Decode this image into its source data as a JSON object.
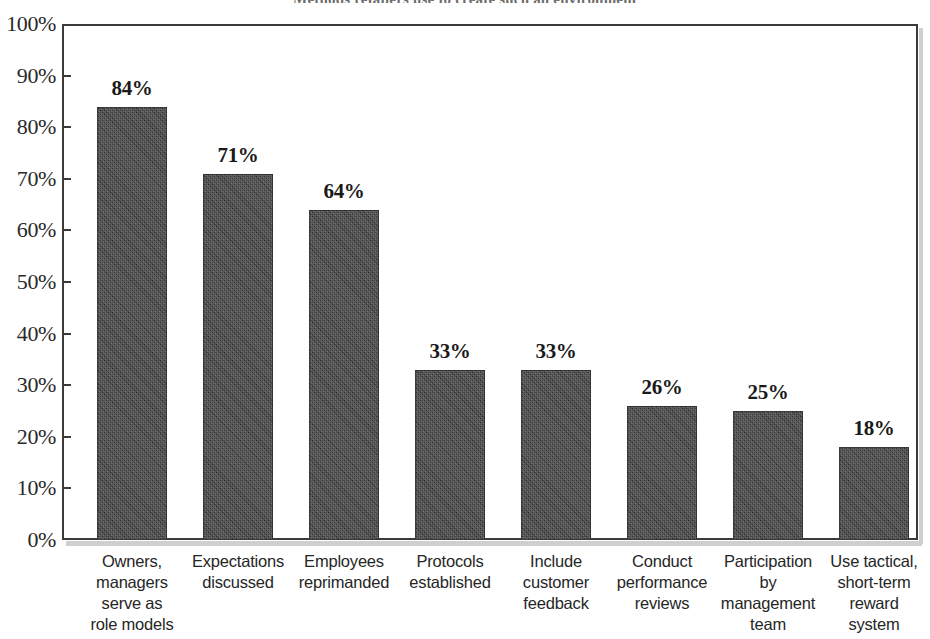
{
  "chart_data": {
    "type": "bar",
    "title": "Methods retailers use to create such an environment",
    "title_truncated": true,
    "xlabel": "",
    "ylabel": "",
    "ylim": [
      0,
      100
    ],
    "ytick_labels": [
      "100%",
      "90%",
      "80%",
      "70%",
      "60%",
      "50%",
      "40%",
      "30%",
      "20%",
      "10%",
      "0%"
    ],
    "ytick_values": [
      100,
      90,
      80,
      70,
      60,
      50,
      40,
      30,
      20,
      10,
      0
    ],
    "grid": false,
    "legend": false,
    "orientation": "vertical",
    "bar_color": "#3f3f3f",
    "categories": [
      "Owners, managers serve as role models",
      "Expectations discussed",
      "Employees reprimanded",
      "Protocols established",
      "Include customer feedback",
      "Conduct performance reviews",
      "Participation by management team",
      "Use tactical, short-term reward system"
    ],
    "category_lines": [
      [
        "Owners,",
        "managers",
        "serve as",
        "role models"
      ],
      [
        "Expectations",
        "discussed"
      ],
      [
        "Employees",
        "reprimanded"
      ],
      [
        "Protocols",
        "established"
      ],
      [
        "Include",
        "customer",
        "feedback"
      ],
      [
        "Conduct",
        "performance",
        "reviews"
      ],
      [
        "Participation",
        "by",
        "management",
        "team"
      ],
      [
        "Use tactical,",
        "short-term",
        "reward",
        "system"
      ]
    ],
    "values": [
      84,
      71,
      64,
      33,
      33,
      26,
      25,
      18
    ],
    "value_labels": [
      "84%",
      "71%",
      "64%",
      "33%",
      "33%",
      "26%",
      "25%",
      "18%"
    ]
  },
  "colors": {
    "bar": "#3f3f3f",
    "frame": "#3b3b3b",
    "text": "#262626",
    "background": "#ffffff"
  }
}
